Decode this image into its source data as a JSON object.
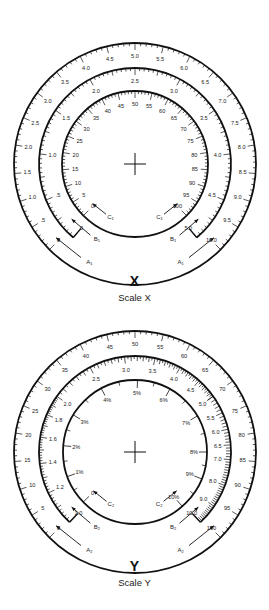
{
  "diagrams": [
    {
      "id": "X",
      "letter": "X",
      "caption": "Scale X",
      "center": [
        135,
        164
      ],
      "rings": [
        {
          "name": "A1",
          "radius": 121,
          "full_circle": true,
          "start_angle": -135,
          "end_angle": 135,
          "min": 0,
          "max": 10,
          "type": "linear",
          "minor_step": 0.1,
          "mid_step": 0.5,
          "labels": [
            "0",
            ".5",
            "1.0",
            "1.5",
            "2.0",
            "2.5",
            "3.0",
            "3.5",
            "4.0",
            "4.5",
            "5.0",
            "5.5",
            "6.0",
            "6.5",
            "7.0",
            "7.5",
            "8.0",
            "8.5",
            "9.0",
            "9.5",
            "10.0"
          ],
          "label_values": [
            0,
            0.5,
            1,
            1.5,
            2,
            2.5,
            3,
            3.5,
            4,
            4.5,
            5,
            5.5,
            6,
            6.5,
            7,
            7.5,
            8,
            8.5,
            9,
            9.5,
            10
          ]
        },
        {
          "name": "B1",
          "radius": 96,
          "full_circle": false,
          "start_angle": -140,
          "end_angle": 140,
          "min": 0,
          "max": 5,
          "type": "linear",
          "minor_step": 0.05,
          "mid_step": 0.25,
          "labels": [
            "0",
            ".5",
            "1.0",
            "1.5",
            "2.0",
            "2.5",
            "3.0",
            "3.5",
            "4.0",
            "4.5",
            "5.0"
          ],
          "label_values": [
            0,
            0.5,
            1,
            1.5,
            2,
            2.5,
            3,
            3.5,
            4,
            4.5,
            5
          ]
        },
        {
          "name": "C1",
          "radius": 73,
          "full_circle": true,
          "start_angle": -135,
          "end_angle": 135,
          "min": 0,
          "max": 100,
          "type": "linear",
          "minor_step": 1,
          "mid_step": 5,
          "labels": [
            "0",
            "5",
            "10",
            "15",
            "20",
            "25",
            "30",
            "35",
            "40",
            "45",
            "50",
            "55",
            "60",
            "65",
            "70",
            "75",
            "80",
            "85",
            "90",
            "95",
            "100"
          ],
          "label_values": [
            0,
            5,
            10,
            15,
            20,
            25,
            30,
            35,
            40,
            45,
            50,
            55,
            60,
            65,
            70,
            75,
            80,
            85,
            90,
            95,
            100
          ]
        }
      ],
      "arrows": [
        {
          "label": "C",
          "sub": "1",
          "side": "left",
          "radius": 58,
          "angle": -150
        },
        {
          "label": "C",
          "sub": "1",
          "side": "right",
          "radius": 58,
          "angle": 150
        },
        {
          "label": "B",
          "sub": "1",
          "side": "left",
          "radius": 84,
          "angle": -148
        },
        {
          "label": "B",
          "sub": "1",
          "side": "right",
          "radius": 84,
          "angle": 148
        },
        {
          "label": "A",
          "sub": "1",
          "side": "left",
          "radius": 108,
          "angle": -150
        },
        {
          "label": "A",
          "sub": "1",
          "side": "right",
          "radius": 108,
          "angle": 150
        }
      ]
    },
    {
      "id": "Y",
      "letter": "Y",
      "caption": "Scale Y",
      "center": [
        135,
        452
      ],
      "rings": [
        {
          "name": "A2",
          "radius": 121,
          "full_circle": true,
          "start_angle": -135,
          "end_angle": 135,
          "min": 0,
          "max": 100,
          "type": "linear",
          "minor_step": 1,
          "mid_step": 5,
          "labels": [
            "0",
            "5",
            "10",
            "15",
            "20",
            "25",
            "30",
            "35",
            "40",
            "45",
            "50",
            "55",
            "60",
            "65",
            "70",
            "75",
            "80",
            "85",
            "90",
            "95",
            "100"
          ],
          "label_values": [
            0,
            5,
            10,
            15,
            20,
            25,
            30,
            35,
            40,
            45,
            50,
            55,
            60,
            65,
            70,
            75,
            80,
            85,
            90,
            95,
            100
          ]
        },
        {
          "name": "B2",
          "radius": 96,
          "full_circle": false,
          "start_angle": -137,
          "end_angle": 137,
          "min": 1,
          "max": 10,
          "type": "log",
          "labels": [
            "1.0",
            "1.2",
            "1.4",
            "1.6",
            "1.8",
            "2.0",
            "2.5",
            "3.0",
            "3.5",
            "4.0",
            "4.5",
            "5.0",
            "5.5",
            "6.0",
            "6.5",
            "7.0",
            "8.0",
            "9.0",
            "10.0"
          ],
          "label_values": [
            1,
            1.2,
            1.4,
            1.6,
            1.8,
            2,
            2.5,
            3,
            3.5,
            4,
            4.5,
            5,
            5.5,
            6,
            6.5,
            7,
            8,
            9,
            10
          ]
        },
        {
          "name": "C2",
          "radius": 72,
          "full_circle": true,
          "type": "custom",
          "labels": [
            "0",
            "1%",
            "2%",
            "3%",
            "4%",
            "5%",
            "6%",
            "7%",
            "8%",
            "9%",
            "10%"
          ],
          "label_angles": [
            -134,
            -110,
            -85,
            -59,
            -28,
            2,
            29,
            60,
            90,
            112,
            139
          ]
        }
      ],
      "arrows": [
        {
          "label": "C",
          "sub": "2",
          "side": "left",
          "radius": 57,
          "angle": -150
        },
        {
          "label": "C",
          "sub": "2",
          "side": "right",
          "radius": 57,
          "angle": 150
        },
        {
          "label": "B",
          "sub": "2",
          "side": "left",
          "radius": 84,
          "angle": -148
        },
        {
          "label": "B",
          "sub": "2",
          "side": "right",
          "radius": 84,
          "angle": 148
        },
        {
          "label": "A",
          "sub": "2",
          "side": "left",
          "radius": 108,
          "angle": -150
        },
        {
          "label": "A",
          "sub": "2",
          "side": "right",
          "radius": 108,
          "angle": 150
        }
      ]
    }
  ],
  "labels": {
    "x_letter": "X",
    "x_caption": "Scale X",
    "y_letter": "Y",
    "y_caption": "Scale Y"
  }
}
